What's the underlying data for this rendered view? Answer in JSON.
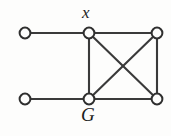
{
  "figure": {
    "name": "graph-G",
    "background_color": "#fdfdfc",
    "width": 171,
    "height": 136
  },
  "style": {
    "edge_color": "#3a3a3a",
    "edge_width": 2.1,
    "vertex_stroke_color": "#2f2f2f",
    "vertex_fill_color": "#fdfdfc",
    "vertex_radius": 5.4,
    "label_color": "#1c1c1c"
  },
  "labels": [
    {
      "id": "x",
      "text": "x",
      "anchor_vertex": "top-middle",
      "position": "above"
    },
    {
      "id": "G",
      "text": "G",
      "anchor_vertex": "bottom-middle",
      "position": "below"
    }
  ],
  "chart_data": {
    "type": "diagram",
    "title": "G",
    "graph": {
      "directed": false,
      "vertex_count": 6,
      "edge_count": 8,
      "vertices": [
        {
          "id": "v1",
          "name": "top-left",
          "x": 25,
          "y": 33,
          "label": ""
        },
        {
          "id": "v2",
          "name": "top-middle",
          "x": 89,
          "y": 33,
          "label": "x"
        },
        {
          "id": "v3",
          "name": "top-right",
          "x": 157,
          "y": 33,
          "label": ""
        },
        {
          "id": "v4",
          "name": "bottom-left",
          "x": 25,
          "y": 99,
          "label": ""
        },
        {
          "id": "v5",
          "name": "bottom-middle",
          "x": 89,
          "y": 99,
          "label": "G"
        },
        {
          "id": "v6",
          "name": "bottom-right",
          "x": 157,
          "y": 99,
          "label": ""
        }
      ],
      "edges": [
        {
          "id": "e1",
          "from": "v1",
          "to": "v2",
          "kind": "horizontal-top-left"
        },
        {
          "id": "e2",
          "from": "v2",
          "to": "v3",
          "kind": "horizontal-top-right"
        },
        {
          "id": "e3",
          "from": "v4",
          "to": "v5",
          "kind": "horizontal-bottom-left"
        },
        {
          "id": "e4",
          "from": "v5",
          "to": "v6",
          "kind": "horizontal-bottom-right"
        },
        {
          "id": "e5",
          "from": "v2",
          "to": "v5",
          "kind": "vertical-middle"
        },
        {
          "id": "e6",
          "from": "v3",
          "to": "v6",
          "kind": "vertical-right"
        },
        {
          "id": "e7",
          "from": "v2",
          "to": "v6",
          "kind": "diagonal-down-right"
        },
        {
          "id": "e8",
          "from": "v3",
          "to": "v5",
          "kind": "diagonal-down-left"
        }
      ]
    }
  }
}
